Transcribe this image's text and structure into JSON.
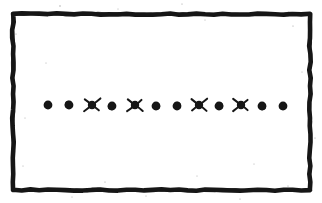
{
  "figure": {
    "background_color": "#ffffff",
    "ink_color": "#161616",
    "width": 322,
    "height": 203,
    "frame": {
      "label": "hand-drawn rectangular border",
      "left": 13,
      "top": 14,
      "right": 310,
      "bottom": 190,
      "stroke_width": 4.6,
      "style": "wavy ink outline"
    },
    "row": {
      "label": "horizontal row of marks",
      "baseline_y": 105,
      "count": 12,
      "dot_count": 8,
      "star_count": 4,
      "dot_radius": 4.4,
      "star_core_radius": 4.2,
      "star_ray_length": 9.5,
      "pattern": "dot dot star dot star dot dot star dot star dot dot",
      "marks": [
        {
          "index": 1,
          "type": "dot",
          "x": 48,
          "y": 105
        },
        {
          "index": 2,
          "type": "dot",
          "x": 69,
          "y": 105
        },
        {
          "index": 3,
          "type": "star",
          "x": 92,
          "y": 105
        },
        {
          "index": 4,
          "type": "dot",
          "x": 112,
          "y": 106
        },
        {
          "index": 5,
          "type": "star",
          "x": 135,
          "y": 105
        },
        {
          "index": 6,
          "type": "dot",
          "x": 156,
          "y": 106
        },
        {
          "index": 7,
          "type": "dot",
          "x": 177,
          "y": 106
        },
        {
          "index": 8,
          "type": "star",
          "x": 199,
          "y": 105
        },
        {
          "index": 9,
          "type": "dot",
          "x": 219,
          "y": 106
        },
        {
          "index": 10,
          "type": "star",
          "x": 241,
          "y": 105
        },
        {
          "index": 11,
          "type": "dot",
          "x": 262,
          "y": 106
        },
        {
          "index": 12,
          "type": "dot",
          "x": 283,
          "y": 106
        }
      ]
    },
    "speckles": [
      {
        "x": 60,
        "y": 6,
        "r": 0.7
      },
      {
        "x": 182,
        "y": 4,
        "r": 0.6
      },
      {
        "x": 118,
        "y": 9,
        "r": 0.5
      },
      {
        "x": 205,
        "y": 20,
        "r": 0.5
      },
      {
        "x": 16,
        "y": 34,
        "r": 0.6
      },
      {
        "x": 293,
        "y": 26,
        "r": 0.6
      },
      {
        "x": 46,
        "y": 63,
        "r": 0.5
      },
      {
        "x": 302,
        "y": 72,
        "r": 0.5
      },
      {
        "x": 25,
        "y": 118,
        "r": 0.5
      },
      {
        "x": 315,
        "y": 138,
        "r": 0.6
      },
      {
        "x": 23,
        "y": 166,
        "r": 0.5
      },
      {
        "x": 105,
        "y": 182,
        "r": 0.6
      },
      {
        "x": 197,
        "y": 176,
        "r": 0.5
      },
      {
        "x": 254,
        "y": 164,
        "r": 0.5
      },
      {
        "x": 288,
        "y": 186,
        "r": 0.6
      },
      {
        "x": 146,
        "y": 196,
        "r": 0.5
      },
      {
        "x": 72,
        "y": 197,
        "r": 0.5
      },
      {
        "x": 240,
        "y": 199,
        "r": 0.6
      }
    ]
  }
}
